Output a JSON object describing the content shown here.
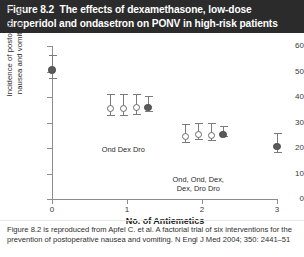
{
  "figure": {
    "title": "Figure 8.2  The effects of dexamethasone, low-dose droperidol and ondasetron on PONV in high-risk patients",
    "caption_line1": "Figure 8.2 is reproduced from Apfel C. et al. A factorial trial of six interventions for the",
    "caption_line2": "prevention of postoperative nausea and vomiting. N Engl J Med 2004; 350: 2441–51"
  },
  "chart_data": {
    "type": "scatter",
    "title": "The effects of dexamethasone, low-dose droperidol and ondasetron on PONV in high-risk patients",
    "xlabel": "No. of Antiemetics",
    "ylabel": "Incidence of postoperative nausea and vomiting (%)",
    "xlim": [
      0,
      3
    ],
    "ylim": [
      0,
      60
    ],
    "xticks": [
      "0",
      "1",
      "2",
      "3"
    ],
    "yticks": [
      "0",
      "10",
      "20",
      "30",
      "40",
      "50",
      "60"
    ],
    "grid": false,
    "legend": "none",
    "error_bar_type": "95% CI",
    "points": [
      {
        "id": "p0",
        "x": 0.0,
        "y": 52.0,
        "ylow": 47.5,
        "yhigh": 56.5,
        "marker": "filled",
        "label": ""
      },
      {
        "id": "p1a",
        "x": 0.78,
        "y": 37.0,
        "ylow": 33.0,
        "yhigh": 41.0,
        "marker": "open",
        "label": "Ond"
      },
      {
        "id": "p1b",
        "x": 0.95,
        "y": 37.0,
        "ylow": 33.0,
        "yhigh": 41.0,
        "marker": "open",
        "label": "Dex"
      },
      {
        "id": "p1c",
        "x": 1.12,
        "y": 37.2,
        "ylow": 33.2,
        "yhigh": 41.2,
        "marker": "open",
        "label": "Dro"
      },
      {
        "id": "p1d",
        "x": 1.28,
        "y": 37.4,
        "ylow": 34.6,
        "yhigh": 40.2,
        "marker": "filled",
        "label": ""
      },
      {
        "id": "p2a",
        "x": 1.78,
        "y": 26.0,
        "ylow": 22.5,
        "yhigh": 29.5,
        "marker": "open",
        "label": "Ond,\nDex,"
      },
      {
        "id": "p2b",
        "x": 1.95,
        "y": 26.6,
        "ylow": 23.4,
        "yhigh": 30.0,
        "marker": "open",
        "label": "Ond,\nDro"
      },
      {
        "id": "p2c",
        "x": 2.12,
        "y": 26.4,
        "ylow": 23.0,
        "yhigh": 29.8,
        "marker": "open",
        "label": "Dex,\nDro"
      },
      {
        "id": "p2d",
        "x": 2.28,
        "y": 26.8,
        "ylow": 24.8,
        "yhigh": 28.8,
        "marker": "filled",
        "label": ""
      },
      {
        "id": "p3",
        "x": 3.0,
        "y": 22.0,
        "ylow": 18.5,
        "yhigh": 26.0,
        "marker": "filled",
        "label": ""
      }
    ],
    "group_annotations": [
      {
        "id": "g1",
        "x": 0.95,
        "text": "Ond Dex Dro"
      },
      {
        "id": "g2",
        "x": 1.95,
        "text": "Ond, Ond, Dex,\nDex, Dro  Dro"
      }
    ]
  }
}
